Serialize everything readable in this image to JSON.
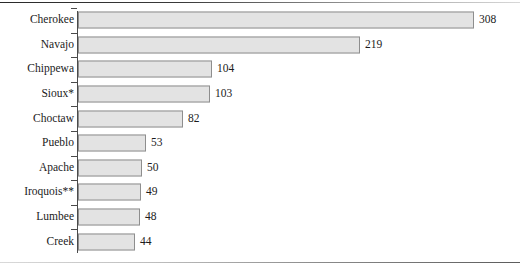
{
  "chart_data": {
    "type": "bar",
    "orientation": "horizontal",
    "title": "",
    "subtitle": "",
    "xlabel": "",
    "ylabel": "",
    "grid": false,
    "legend": null,
    "axis_max": 308,
    "categories": [
      "Cherokee",
      "Navajo",
      "Chippewa",
      "Sioux*",
      "Choctaw",
      "Pueblo",
      "Apache",
      "Iroquois**",
      "Lumbee",
      "Creek"
    ],
    "values": [
      308,
      219,
      104,
      103,
      82,
      53,
      50,
      49,
      48,
      44
    ],
    "value_labels": [
      "308",
      "219",
      "104",
      "103",
      "82",
      "53",
      "50",
      "49",
      "48",
      "44"
    ],
    "bars": [
      {
        "category": "Cherokee",
        "value": 308,
        "label": "308"
      },
      {
        "category": "Navajo",
        "value": 219,
        "label": "219"
      },
      {
        "category": "Chippewa",
        "value": 104,
        "label": "104"
      },
      {
        "category": "Sioux*",
        "value": 103,
        "label": "103"
      },
      {
        "category": "Choctaw",
        "value": 82,
        "label": "82"
      },
      {
        "category": "Pueblo",
        "value": 53,
        "label": "53"
      },
      {
        "category": "Apache",
        "value": 50,
        "label": "50"
      },
      {
        "category": "Iroquois**",
        "value": 49,
        "label": "49"
      },
      {
        "category": "Lumbee",
        "value": 48,
        "label": "48"
      },
      {
        "category": "Creek",
        "value": 44,
        "label": "44"
      }
    ],
    "colors": {
      "bar_fill": "#e3e3e3",
      "bar_border": "#8e8e8e",
      "axis": "#4a4a4a",
      "text": "#1b1b1b",
      "background": "#ffffff"
    }
  }
}
